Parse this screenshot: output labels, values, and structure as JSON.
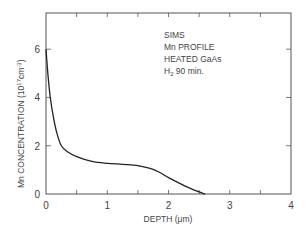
{
  "chart_data": {
    "type": "line",
    "title": "",
    "xlabel": "DEPTH (μm)",
    "ylabel": "Mn CONCENTRATION (10¹⁷cm⁻³)",
    "xlim": [
      0,
      4
    ],
    "ylim": [
      0,
      7.5
    ],
    "xticks": [
      "0",
      "1",
      "2",
      "3",
      "4"
    ],
    "yticks": [
      "0",
      "2",
      "4",
      "6"
    ],
    "grid": false,
    "legend": null,
    "annotations": [
      "SIMS",
      "Mn PROFILE",
      "HEATED GaAs",
      "H₂  90 min."
    ],
    "series": [
      {
        "name": "Mn profile",
        "x": [
          0,
          0.03,
          0.07,
          0.12,
          0.18,
          0.25,
          0.35,
          0.5,
          0.75,
          1.0,
          1.25,
          1.5,
          1.7,
          1.85,
          2.0,
          2.2,
          2.4,
          2.55,
          2.6
        ],
        "values": [
          6.0,
          5.0,
          4.0,
          3.2,
          2.5,
          2.0,
          1.75,
          1.55,
          1.35,
          1.27,
          1.23,
          1.18,
          1.06,
          0.9,
          0.68,
          0.42,
          0.18,
          0.04,
          0.0
        ]
      }
    ]
  },
  "labels": {
    "xlabel_main": "DEPTH (",
    "xlabel_unit": "μm",
    "xlabel_close": ")",
    "ylabel_main": "Mn  CONCENTRATION (10",
    "ylabel_exp": "17",
    "ylabel_unit": "cm",
    "ylabel_exp2": "-3",
    "ylabel_close": ")",
    "annot": {
      "line1": "SIMS",
      "line2": "Mn PROFILE",
      "line3": "HEATED  GaAs",
      "line4_h": "H",
      "line4_sub": "2",
      "line4_rest": "  90 min."
    }
  },
  "colors": {
    "axis": "#555555",
    "line": "#222222",
    "text": "#444444"
  }
}
